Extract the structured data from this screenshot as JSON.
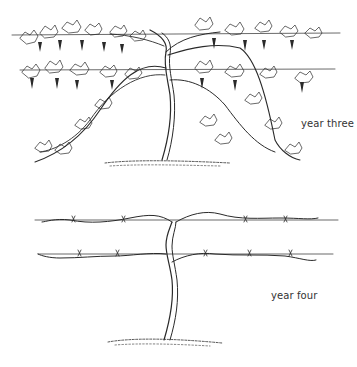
{
  "illustration": {
    "title": "Grapevine cordon training stages",
    "stages": [
      {
        "id": "year-three",
        "label": "year three"
      },
      {
        "id": "year-four",
        "label": "year four"
      }
    ],
    "colors": {
      "ink": "#2a2a2a",
      "background": "#ffffff",
      "label": "#333333"
    }
  }
}
